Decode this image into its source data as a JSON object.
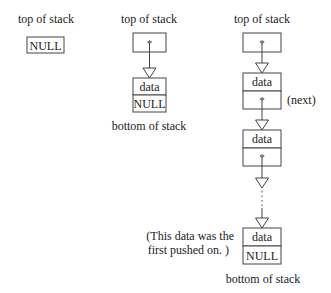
{
  "diagram": {
    "empty_stack": {
      "top_label": "top of stack",
      "node_value": "NULL"
    },
    "one_node_stack": {
      "top_label": "top of stack",
      "pointer": "*",
      "node": {
        "data": "data",
        "next": "NULL"
      },
      "bottom_label": "bottom of stack"
    },
    "multi_node_stack": {
      "top_label": "top of stack",
      "pointer": "*",
      "nodes": [
        {
          "data": "data",
          "next": "*"
        },
        {
          "data": "data",
          "next": "*"
        },
        {
          "data": "data",
          "next": "NULL"
        }
      ],
      "next_annotation": "(next)",
      "ellipsis": "...",
      "first_pushed_note_line1": "(This data was the",
      "first_pushed_note_line2": "first pushed on. )",
      "bottom_label": "bottom of stack"
    }
  }
}
